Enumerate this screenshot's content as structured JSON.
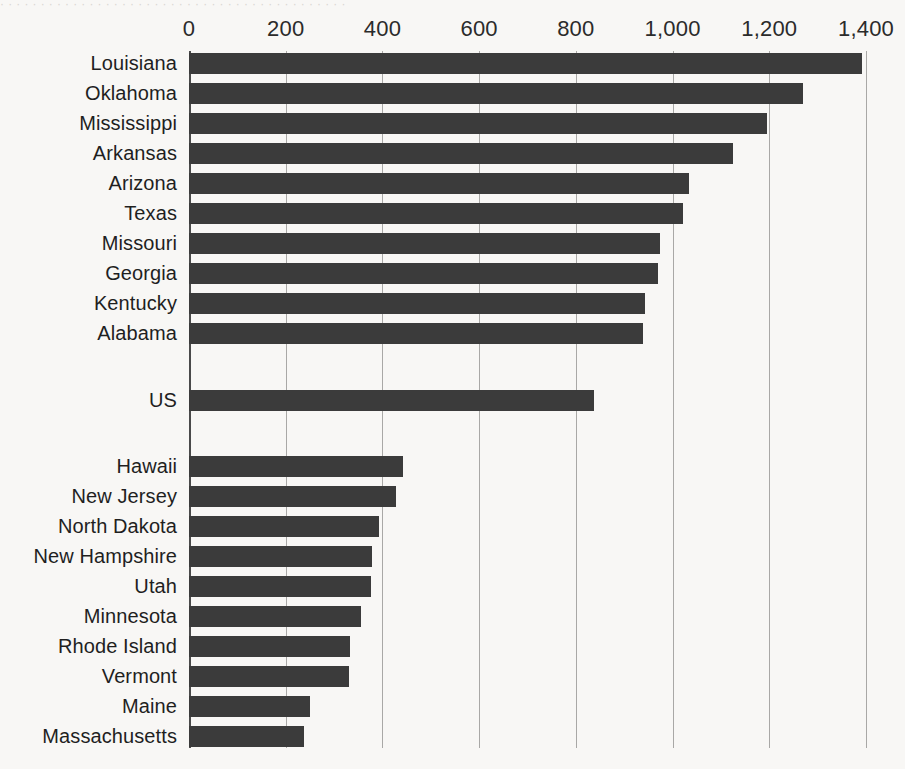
{
  "top_remnant_text": "· · · · · · · · · · · · · · · · · · · · · · · · · · · · · · · · · · · · · · · · · · ·",
  "axis": {
    "tick_labels": [
      "0",
      "200",
      "400",
      "600",
      "800",
      "1,000",
      "1,200",
      "1,400"
    ],
    "tick_values": [
      0,
      200,
      400,
      600,
      800,
      1000,
      1200,
      1400
    ],
    "min": 0,
    "max": 1400
  },
  "colors": {
    "bar": "#3b3b3b",
    "gridline": "#a9a8a6",
    "axis": "#4a4a4a",
    "background": "#f8f7f5",
    "text": "#1f1f1f"
  },
  "chart_data": {
    "type": "bar",
    "orientation": "horizontal",
    "title": "",
    "subtitle": "",
    "xlabel": "",
    "ylabel": "",
    "xlim": [
      0,
      1400
    ],
    "grid": true,
    "legend": "none",
    "xticks": [
      0,
      200,
      400,
      600,
      800,
      1000,
      1200,
      1400
    ],
    "xticklabels": [
      "0",
      "200",
      "400",
      "600",
      "800",
      "1,000",
      "1,200",
      "1,400"
    ],
    "groups": [
      {
        "name": "highest-states",
        "categories": [
          "Louisiana",
          "Oklahoma",
          "Mississippi",
          "Arkansas",
          "Arizona",
          "Texas",
          "Missouri",
          "Georgia",
          "Kentucky",
          "Alabama"
        ],
        "values": [
          1391,
          1269,
          1195,
          1124,
          1035,
          1021,
          973,
          969,
          942,
          938
        ]
      },
      {
        "name": "national",
        "categories": [
          "US"
        ],
        "values": [
          837
        ]
      },
      {
        "name": "lowest-states",
        "categories": [
          "Hawaii",
          "New Jersey",
          "North Dakota",
          "New Hampshire",
          "Utah",
          "Minnesota",
          "Rhode Island",
          "Vermont",
          "Maine",
          "Massachusetts"
        ],
        "values": [
          443,
          429,
          392,
          379,
          377,
          356,
          332,
          330,
          251,
          238
        ]
      }
    ],
    "categories": [
      "Louisiana",
      "Oklahoma",
      "Mississippi",
      "Arkansas",
      "Arizona",
      "Texas",
      "Missouri",
      "Georgia",
      "Kentucky",
      "Alabama",
      "US",
      "Hawaii",
      "New Jersey",
      "North Dakota",
      "New Hampshire",
      "Utah",
      "Minnesota",
      "Rhode Island",
      "Vermont",
      "Maine",
      "Massachusetts"
    ],
    "values": [
      1391,
      1269,
      1195,
      1124,
      1035,
      1021,
      973,
      969,
      942,
      938,
      837,
      443,
      429,
      392,
      379,
      377,
      356,
      332,
      330,
      251,
      238
    ]
  },
  "rows": [
    {
      "label": "Louisiana",
      "value": 1391,
      "top": 53
    },
    {
      "label": "Oklahoma",
      "value": 1269,
      "top": 83
    },
    {
      "label": "Mississippi",
      "value": 1195,
      "top": 113
    },
    {
      "label": "Arkansas",
      "value": 1124,
      "top": 143
    },
    {
      "label": "Arizona",
      "value": 1035,
      "top": 173
    },
    {
      "label": "Texas",
      "value": 1021,
      "top": 203
    },
    {
      "label": "Missouri",
      "value": 973,
      "top": 233
    },
    {
      "label": "Georgia",
      "value": 969,
      "top": 263
    },
    {
      "label": "Kentucky",
      "value": 942,
      "top": 293
    },
    {
      "label": "Alabama",
      "value": 938,
      "top": 323
    },
    {
      "label": "US",
      "value": 837,
      "top": 390
    },
    {
      "label": "Hawaii",
      "value": 443,
      "top": 456
    },
    {
      "label": "New Jersey",
      "value": 429,
      "top": 486
    },
    {
      "label": "North Dakota",
      "value": 392,
      "top": 516
    },
    {
      "label": "New Hampshire",
      "value": 379,
      "top": 546
    },
    {
      "label": "Utah",
      "value": 377,
      "top": 576
    },
    {
      "label": "Minnesota",
      "value": 356,
      "top": 606
    },
    {
      "label": "Rhode Island",
      "value": 332,
      "top": 636
    },
    {
      "label": "Vermont",
      "value": 330,
      "top": 666
    },
    {
      "label": "Maine",
      "value": 251,
      "top": 696
    },
    {
      "label": "Massachusetts",
      "value": 238,
      "top": 726
    }
  ]
}
